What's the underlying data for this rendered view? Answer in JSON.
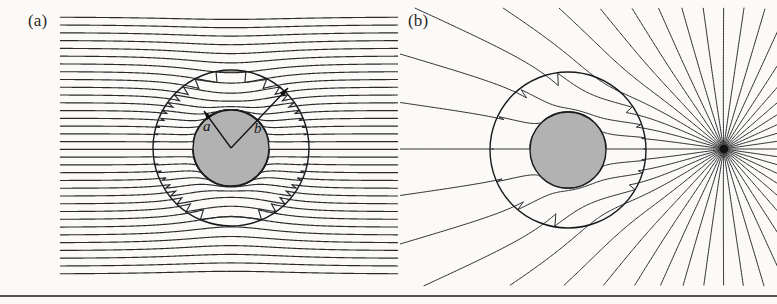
{
  "figure": {
    "width": 777,
    "height": 304,
    "background_color": "#fbfaf8",
    "line_color": "#2b2b2b",
    "shell_fill_color": "#b2b2b2",
    "shell_stroke_color": "#1a1a1a",
    "rule_color": "#1c1c1c",
    "caption_rule": {
      "y": 296,
      "x_start": 0,
      "x_end": 777,
      "thickness": 1.6
    }
  },
  "panels": [
    {
      "id": "panel-a",
      "label": "(a)",
      "label_x": 28,
      "label_y": 11,
      "type": "uniform-field",
      "description": "Uniform horizontal field lines distorted by a high-permeability spherical shell",
      "center": {
        "x": 231,
        "y": 148
      },
      "inner_radius": 38,
      "outer_radius": 78,
      "field": {
        "orientation": "horizontal",
        "x_start": 60,
        "x_end": 398,
        "y_first": 17,
        "y_last": 274,
        "line_count": 34,
        "spacing": 7.8,
        "stroke_width": 1.15
      },
      "annotations": {
        "vertex": {
          "x": 231,
          "y": 148
        },
        "arrows": [
          {
            "name": "inner-radius-arrow",
            "label": "a",
            "tip_x": 204,
            "tip_y": 111,
            "label_x": 203,
            "label_y": 118
          },
          {
            "name": "outer-radius-arrow",
            "label": "b",
            "tip_x": 288,
            "tip_y": 88,
            "label_x": 254,
            "label_y": 120
          }
        ],
        "arrow_stroke_width": 1.3,
        "arrow_head_length": 9,
        "arrow_head_width": 6
      }
    },
    {
      "id": "panel-b",
      "label": "(b)",
      "label_x": 408,
      "label_y": 11,
      "type": "point-source-field",
      "description": "Radial field lines from a point charge distorted by a spherical shell",
      "center": {
        "x": 568,
        "y": 150
      },
      "inner_radius": 38,
      "outer_radius": 78,
      "point_source": {
        "name": "point-charge",
        "x": 724,
        "y": 149,
        "dot_radius": 4.2,
        "color": "#111111"
      },
      "field": {
        "ray_count": 44,
        "angle_start_deg": -180,
        "angle_end_deg": 180,
        "max_extent": 185,
        "clip_left": 400,
        "clip_right": 777,
        "clip_top": 8,
        "clip_bottom": 286,
        "stroke_width": 1.0
      }
    }
  ],
  "chart_data": {
    "type": "line",
    "xlabel": "",
    "ylabel": "",
    "series": [
      {
        "name": "panel-a-uniform-field-lines",
        "count": 34,
        "geometry": "horizontal streamlines, shielded inside inner radius a"
      },
      {
        "name": "panel-b-point-source-rays",
        "count": 44,
        "geometry": "radial streamlines from external point source, shielded inside inner radius a"
      }
    ],
    "annotations": [
      "a",
      "b",
      "(a)",
      "(b)"
    ],
    "legend": "none",
    "grid": false
  }
}
